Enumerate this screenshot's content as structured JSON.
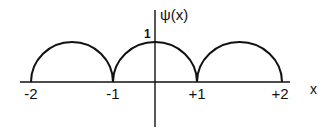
{
  "diagram": {
    "function_label": "ψ(x)",
    "x_axis_label": "x",
    "y_peak_label": "1",
    "x_ticks": [
      {
        "label": "-2",
        "value": -2
      },
      {
        "label": "-1",
        "value": -1
      },
      {
        "label": "+1",
        "value": 1
      },
      {
        "label": "+2",
        "value": 2
      }
    ],
    "arcs": [
      {
        "from": -2,
        "to": -1,
        "peak": 1
      },
      {
        "from": -1,
        "to": 1,
        "peak": 1
      },
      {
        "from": 1,
        "to": 2,
        "peak": 1
      }
    ],
    "stroke_color": "#111111"
  }
}
